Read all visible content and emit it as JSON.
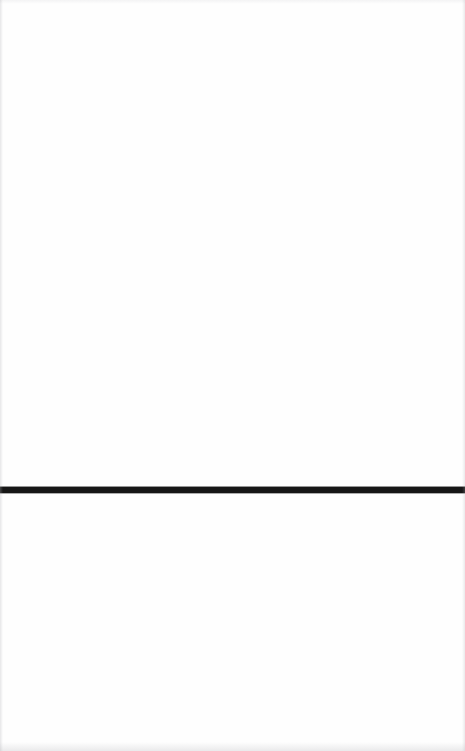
{
  "document": {
    "type": "scanned-page",
    "width_px": 465,
    "height_px": 751,
    "background_color": "#fefefe",
    "text_content": ""
  },
  "rule": {
    "name": "horizontal-rule",
    "color": "#161616",
    "top_px": 487,
    "height_px": 6,
    "left_px": 0,
    "width_px": 465,
    "orientation": "horizontal",
    "spans_full_width": true
  },
  "regions": {
    "upper": {
      "label": "",
      "top_px": 0,
      "height_px": 487,
      "content": ""
    },
    "lower": {
      "label": "",
      "top_px": 493,
      "height_px": 258,
      "content": ""
    }
  },
  "artifacts": {
    "left_edge_color": "#afafb4",
    "right_edge_color": "#afafb4",
    "bottom_edge_color": "#b0b0b5",
    "top_edge_color": "#b4b4b9"
  }
}
